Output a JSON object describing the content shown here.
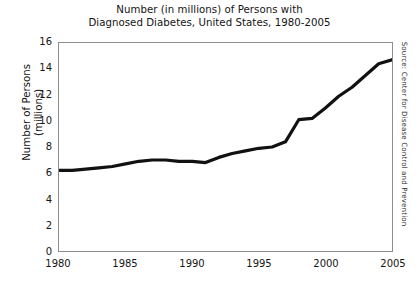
{
  "chart_data": {
    "type": "line",
    "title": "Number (in millions) of Persons with Diagnosed Diabetes, United States, 1980-2005",
    "title_lines": [
      "Number (in millions) of Persons with",
      "Diagnosed Diabetes, United States, 1980-2005"
    ],
    "xlabel": "",
    "ylabel": "Number of Persons (millions)",
    "ylabel_lines": [
      "Number of Persons",
      "(millions)"
    ],
    "xlim": [
      1980,
      2005
    ],
    "ylim": [
      0,
      16
    ],
    "yticks": [
      0,
      2,
      4,
      6,
      8,
      10,
      12,
      14,
      16
    ],
    "xticks": [
      1980,
      1985,
      1990,
      1995,
      2000,
      2005
    ],
    "xtick_labels": [
      "1980",
      "1985",
      "1990",
      "1995",
      "2000",
      "2005"
    ],
    "ytick_labels": [
      "0",
      "2",
      "4",
      "6",
      "8",
      "10",
      "12",
      "14",
      "16"
    ],
    "grid": false,
    "legend": false,
    "line_color": "#111111",
    "line_width_px": 3.2,
    "frame_color": "#8d8d8d",
    "background": "#ffffff",
    "x": [
      1980,
      1981,
      1982,
      1983,
      1984,
      1985,
      1986,
      1987,
      1988,
      1989,
      1990,
      1991,
      1992,
      1993,
      1994,
      1995,
      1996,
      1997,
      1998,
      1999,
      2000,
      2001,
      2002,
      2003,
      2004,
      2005
    ],
    "values": [
      6.2,
      6.2,
      6.3,
      6.4,
      6.5,
      6.7,
      6.9,
      7.0,
      7.0,
      6.9,
      6.9,
      6.8,
      7.2,
      7.5,
      7.7,
      7.9,
      8.0,
      8.1,
      8.4,
      8.3,
      8.4,
      10.1,
      10.2,
      10.2,
      10.8,
      11.6
    ],
    "series": [
      {
        "name": "Persons with diagnosed diabetes (millions)",
        "points": [
          {
            "x": 1980,
            "y": 6.2
          },
          {
            "x": 1981,
            "y": 6.2
          },
          {
            "x": 1982,
            "y": 6.3
          },
          {
            "x": 1983,
            "y": 6.4
          },
          {
            "x": 1984,
            "y": 6.5
          },
          {
            "x": 1985,
            "y": 6.7
          },
          {
            "x": 1986,
            "y": 6.9
          },
          {
            "x": 1987,
            "y": 7.0
          },
          {
            "x": 1988,
            "y": 7.0
          },
          {
            "x": 1989,
            "y": 6.9
          },
          {
            "x": 1990,
            "y": 6.9
          },
          {
            "x": 1991,
            "y": 6.8
          },
          {
            "x": 1992,
            "y": 7.2
          },
          {
            "x": 1993,
            "y": 7.5
          },
          {
            "x": 1994,
            "y": 7.7
          },
          {
            "x": 1995,
            "y": 7.9
          },
          {
            "x": 1996,
            "y": 8.0
          },
          {
            "x": 1997,
            "y": 8.4
          },
          {
            "x": 1998,
            "y": 10.1
          },
          {
            "x": 1999,
            "y": 10.2
          },
          {
            "x": 2000,
            "y": 11.0
          },
          {
            "x": 2001,
            "y": 11.9
          },
          {
            "x": 2002,
            "y": 12.6
          },
          {
            "x": 2003,
            "y": 13.5
          },
          {
            "x": 2004,
            "y": 14.4
          },
          {
            "x": 2005,
            "y": 14.7
          }
        ]
      }
    ],
    "annotations": [
      {
        "name": "source-credit",
        "text": "Source: Center for Disease Control and Prevention",
        "position": "right-margin-vertical"
      }
    ]
  }
}
